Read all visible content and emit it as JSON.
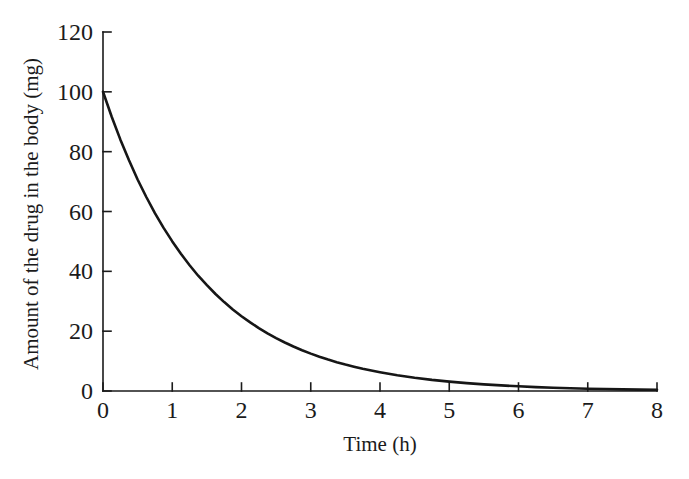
{
  "figure": {
    "x_axis_label": "Time (h)",
    "y_axis_label": "Amount of the drug in the body (mg)"
  },
  "chart_data": {
    "type": "line",
    "title": "",
    "xlabel": "Time (h)",
    "ylabel": "Amount of the drug in the body (mg)",
    "xlim": [
      0,
      8
    ],
    "ylim": [
      0,
      120
    ],
    "xticks": [
      0,
      1,
      2,
      3,
      4,
      5,
      6,
      7,
      8
    ],
    "yticks": [
      0,
      20,
      40,
      60,
      80,
      100,
      120
    ],
    "grid": false,
    "legend": "none",
    "colors": {
      "curve": "#161616",
      "axis": "#1b1b1b",
      "background": "#ffffff"
    },
    "series": [
      {
        "name": "drug-amount",
        "description": "exponential decay, initial dose 100 mg, half-life ~1 h (A = 100·0.5^t)",
        "points": [
          [
            0,
            100
          ],
          [
            0.125,
            91.7
          ],
          [
            0.25,
            84.09
          ],
          [
            0.375,
            77.11
          ],
          [
            0.5,
            70.71
          ],
          [
            0.625,
            64.84
          ],
          [
            0.75,
            59.46
          ],
          [
            0.875,
            54.53
          ],
          [
            1,
            50
          ],
          [
            1.125,
            45.85
          ],
          [
            1.25,
            42.04
          ],
          [
            1.375,
            38.55
          ],
          [
            1.5,
            35.36
          ],
          [
            1.625,
            32.42
          ],
          [
            1.75,
            29.73
          ],
          [
            1.875,
            27.26
          ],
          [
            2,
            25
          ],
          [
            2.125,
            22.92
          ],
          [
            2.25,
            21.02
          ],
          [
            2.375,
            19.28
          ],
          [
            2.5,
            17.68
          ],
          [
            2.625,
            16.21
          ],
          [
            2.75,
            14.87
          ],
          [
            2.875,
            13.63
          ],
          [
            3,
            12.5
          ],
          [
            3.125,
            11.46
          ],
          [
            3.25,
            10.51
          ],
          [
            3.375,
            9.64
          ],
          [
            3.5,
            8.84
          ],
          [
            3.625,
            8.11
          ],
          [
            3.75,
            7.43
          ],
          [
            3.875,
            6.82
          ],
          [
            4,
            6.25
          ],
          [
            4.25,
            5.26
          ],
          [
            4.5,
            4.42
          ],
          [
            4.75,
            3.72
          ],
          [
            5,
            3.13
          ],
          [
            5.25,
            2.63
          ],
          [
            5.5,
            2.21
          ],
          [
            5.75,
            1.86
          ],
          [
            6,
            1.56
          ],
          [
            6.25,
            1.31
          ],
          [
            6.5,
            1.1
          ],
          [
            6.75,
            0.92
          ],
          [
            7,
            0.78
          ],
          [
            7.25,
            0.66
          ],
          [
            7.5,
            0.55
          ],
          [
            7.75,
            0.46
          ],
          [
            8,
            0.39
          ]
        ]
      }
    ]
  }
}
